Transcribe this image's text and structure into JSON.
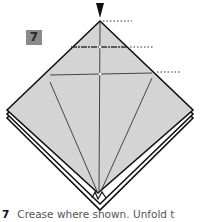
{
  "figure": {
    "step_number": "7",
    "caption_step": "7",
    "caption_text": "Crease where shown. Unfold t",
    "colors": {
      "paper": "#d4d4d4",
      "paper_under": "#ffffff",
      "outline": "#111111",
      "badge": "#8a8a8a",
      "guide_dots": "#333333"
    },
    "symbols": [
      "push-arrow",
      "crease-lines",
      "reference-dotted-lines"
    ]
  }
}
